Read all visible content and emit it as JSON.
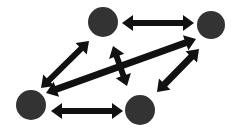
{
  "canvas": {
    "width": 241,
    "height": 133,
    "background_color": "#ffffff",
    "title": "Bidirectional node network diagram"
  },
  "style": {
    "node_fill": "#333333",
    "node_radius": 14,
    "edge_color": "#111111",
    "edge_thickness_thick": 7,
    "edge_thickness_medium": 6,
    "arrowhead_length": 11,
    "arrowhead_width": 16
  },
  "chart_data": {
    "type": "diagram",
    "layout": "node-link",
    "node_count": 5,
    "edge_count": 6,
    "nodes": [
      {
        "id": "n1",
        "name": "top-left-node",
        "cx": 103,
        "cy": 22,
        "r": 15
      },
      {
        "id": "n2",
        "name": "top-right-node",
        "cx": 211,
        "cy": 25,
        "r": 14
      },
      {
        "id": "n3",
        "name": "bottom-left-node",
        "cx": 31,
        "cy": 105,
        "r": 15
      },
      {
        "id": "n4",
        "name": "bottom-middle-node",
        "cx": 140,
        "cy": 110,
        "r": 15
      },
      {
        "id": "n5",
        "name": "center-stub-node",
        "cx": 119,
        "cy": 66,
        "r": 0
      }
    ],
    "edges": [
      {
        "id": "e1",
        "name": "edge-top-horizontal",
        "from": "n1",
        "to": "n2",
        "direction": "bidirectional",
        "x1": 122,
        "y1": 23,
        "x2": 194,
        "y2": 23,
        "thickness": 6
      },
      {
        "id": "e2",
        "name": "edge-bottom-horizontal",
        "from": "n3",
        "to": "n4",
        "direction": "bidirectional",
        "x1": 51,
        "y1": 111,
        "x2": 123,
        "y2": 111,
        "thickness": 6
      },
      {
        "id": "e3",
        "name": "edge-left-diagonal",
        "from": "n3",
        "to": "n1",
        "direction": "bidirectional",
        "x1": 41,
        "y1": 88,
        "x2": 89,
        "y2": 41,
        "thickness": 6
      },
      {
        "id": "e4",
        "name": "edge-long-diagonal",
        "from": "n3",
        "to": "n2",
        "direction": "bidirectional",
        "x1": 46,
        "y1": 93,
        "x2": 196,
        "y2": 39,
        "thickness": 7
      },
      {
        "id": "e5",
        "name": "edge-right-diagonal",
        "from": "n4",
        "to": "n2",
        "direction": "bidirectional",
        "x1": 157,
        "y1": 92,
        "x2": 199,
        "y2": 49,
        "thickness": 7
      },
      {
        "id": "e6",
        "name": "edge-center-vertical-stub",
        "from": "n1",
        "to": "n4",
        "direction": "bidirectional",
        "x1": 113,
        "y1": 46,
        "x2": 127,
        "y2": 86,
        "thickness": 6
      }
    ]
  }
}
